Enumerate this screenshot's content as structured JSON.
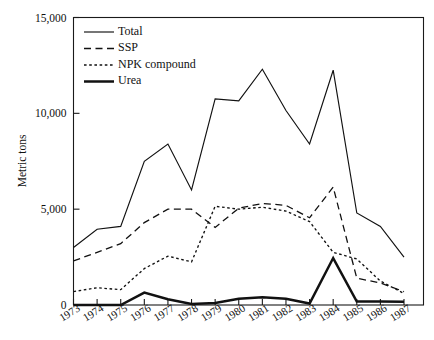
{
  "chart_data": {
    "type": "line",
    "title": "",
    "xlabel": "",
    "ylabel": "Metric tons",
    "categories": [
      "1973",
      "1974",
      "1975",
      "1976",
      "1977",
      "1978",
      "1979",
      "1980",
      "1981",
      "1982",
      "1983",
      "1984",
      "1985",
      "1986",
      "1987"
    ],
    "x": [
      1973,
      1974,
      1975,
      1976,
      1977,
      1978,
      1979,
      1980,
      1981,
      1982,
      1983,
      1984,
      1985,
      1986,
      1987
    ],
    "ylim": [
      0,
      15000
    ],
    "xlim": [
      1973,
      1987
    ],
    "yticks": [
      0,
      5000,
      10000,
      15000
    ],
    "ytick_labels": [
      "0",
      "5,000",
      "10,000",
      "15,000"
    ],
    "grid": false,
    "legend_position": "top-left-inside",
    "series": [
      {
        "name": "Total",
        "style": "solid-thin",
        "values": [
          3000,
          3950,
          4100,
          7500,
          8400,
          6000,
          10750,
          10650,
          12300,
          10150,
          8400,
          12250,
          4800,
          4100,
          2500
        ]
      },
      {
        "name": "SSP",
        "style": "dashed",
        "values": [
          2300,
          2750,
          3200,
          4300,
          5000,
          5000,
          4050,
          5050,
          5300,
          5200,
          4550,
          6150,
          1400,
          1150,
          700
        ]
      },
      {
        "name": "NPK compound",
        "style": "dotted",
        "values": [
          700,
          900,
          800,
          1900,
          2550,
          2250,
          5150,
          5000,
          5100,
          4900,
          4350,
          2750,
          2400,
          1250,
          600
        ]
      },
      {
        "name": "Urea",
        "style": "solid-thick",
        "values": [
          0,
          0,
          0,
          650,
          300,
          50,
          100,
          330,
          400,
          330,
          80,
          2450,
          180,
          180,
          170
        ]
      }
    ]
  },
  "legend": {
    "items": [
      {
        "label": "Total"
      },
      {
        "label": "SSP"
      },
      {
        "label": "NPK compound"
      },
      {
        "label": "Urea"
      }
    ]
  },
  "axes": {
    "y_title": "Metric tons",
    "y_labels": [
      "15,000",
      "10,000",
      "5,000",
      "0"
    ],
    "x_labels": [
      "1973",
      "1974",
      "1975",
      "1976",
      "1977",
      "1978",
      "1979",
      "1980",
      "1981",
      "1982",
      "1983",
      "1984",
      "1985",
      "1986",
      "1987"
    ]
  }
}
